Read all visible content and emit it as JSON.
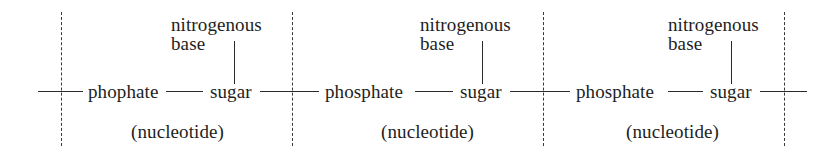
{
  "diagram": {
    "type": "nucleic-acid-chain",
    "line_color": "#2a2a2a",
    "text_color": "#1e1e1e",
    "background": "#ffffff",
    "units": [
      {
        "phosphate_label": "phophate",
        "sugar_label": "sugar",
        "base_label_line1": "nitrogenous",
        "base_label_line2": "base",
        "unit_label": "(nucleotide)"
      },
      {
        "phosphate_label": "phosphate",
        "sugar_label": "sugar",
        "base_label_line1": "nitrogenous",
        "base_label_line2": "base",
        "unit_label": "(nucleotide)"
      },
      {
        "phosphate_label": "phosphate",
        "sugar_label": "sugar",
        "base_label_line1": "nitrogenous",
        "base_label_line2": "base",
        "unit_label": "(nucleotide)"
      }
    ],
    "dividers": 4
  }
}
